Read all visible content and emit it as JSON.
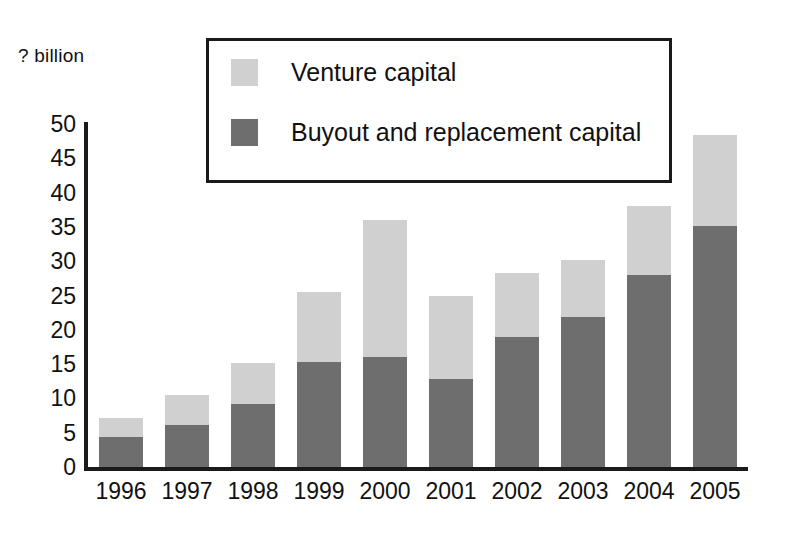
{
  "chart_data": {
    "type": "bar",
    "stacked": true,
    "title": "",
    "subtitle": "",
    "xlabel": "",
    "ylabel": "? billion",
    "ylim": [
      0,
      50
    ],
    "ytick_step": 5,
    "yticks": [
      "50",
      "45",
      "40",
      "35",
      "30",
      "25",
      "20",
      "15",
      "10",
      "5",
      "0"
    ],
    "grid": false,
    "legend_position": "top-center-inside-box",
    "categories": [
      "1996",
      "1997",
      "1998",
      "1999",
      "2000",
      "2001",
      "2002",
      "2003",
      "2004",
      "2005"
    ],
    "series": [
      {
        "name": "Venture capital",
        "color": "#d0d0d0",
        "values": [
          2.7,
          4.4,
          6.0,
          10.2,
          20.0,
          12.1,
          9.4,
          8.3,
          10.0,
          13.3
        ]
      },
      {
        "name": "Buyout and replacement capital",
        "color": "#6e6e6e",
        "values": [
          4.4,
          6.1,
          9.2,
          15.3,
          16.0,
          12.9,
          18.9,
          21.9,
          28.0,
          35.1
        ]
      }
    ],
    "totals": [
      7.1,
      10.5,
      15.2,
      25.5,
      36.0,
      25.0,
      28.3,
      30.2,
      38.0,
      48.4
    ]
  },
  "axis": {
    "y_unit_label": "? billion"
  },
  "legend": {
    "entries": [
      {
        "label": "Venture capital",
        "color": "#d0d0d0"
      },
      {
        "label": "Buyout and replacement capital",
        "color": "#6e6e6e"
      }
    ]
  },
  "colors": {
    "venture": "#d0d0d0",
    "buyout": "#6e6e6e",
    "axis": "#1a1a1a",
    "background": "#ffffff",
    "text": "#111111"
  }
}
